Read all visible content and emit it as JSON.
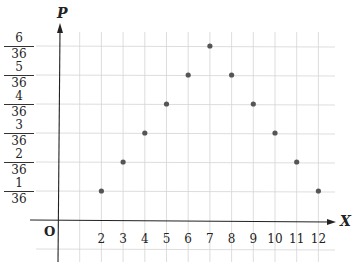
{
  "chart_data": {
    "type": "scatter",
    "title": "",
    "xlabel": "X",
    "ylabel": "P",
    "origin_label": "O",
    "x": [
      2,
      3,
      4,
      5,
      6,
      7,
      8,
      9,
      10,
      11,
      12
    ],
    "y_numerators": [
      1,
      2,
      3,
      4,
      5,
      6,
      5,
      4,
      3,
      2,
      1
    ],
    "y_denominator": 36,
    "y": [
      0.0278,
      0.0556,
      0.0833,
      0.1111,
      0.1389,
      0.1667,
      0.1389,
      0.1111,
      0.0833,
      0.0556,
      0.0278
    ],
    "x_tick_labels": [
      "2",
      "3",
      "4",
      "5",
      "6",
      "7",
      "8",
      "9",
      "10",
      "11",
      "12"
    ],
    "y_tick_labels": [
      {
        "num": "1",
        "den": "36"
      },
      {
        "num": "2",
        "den": "36"
      },
      {
        "num": "3",
        "den": "36"
      },
      {
        "num": "4",
        "den": "36"
      },
      {
        "num": "5",
        "den": "36"
      },
      {
        "num": "6",
        "den": "36"
      }
    ],
    "xlim": [
      0,
      13
    ],
    "ylim": [
      0,
      0.1944
    ],
    "grid": true,
    "legend": null,
    "point_color": "#555555",
    "grid_color": "#d4d4d4",
    "axis_color": "#222222"
  }
}
